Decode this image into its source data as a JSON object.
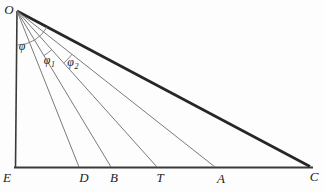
{
  "figure": {
    "background": "#fdfdfd",
    "colors": {
      "triangle_sides": "#3a3a3a",
      "hypotenuse": "#262626",
      "cevian_rays": "#7a7a7a",
      "angle_arcs": "#7a7a7a",
      "labels": "#1c1c1c"
    },
    "labels": {
      "O": "O",
      "E": "E",
      "D": "D",
      "B": "B",
      "T": "T",
      "A": "A",
      "C": "C",
      "phi": "φ",
      "phi1_base": "φ",
      "phi1_sub": "1",
      "phi2_base": "φ",
      "phi2_sub": "2"
    }
  }
}
